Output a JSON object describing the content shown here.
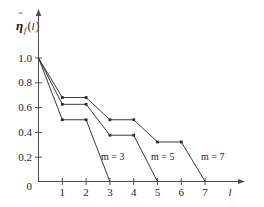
{
  "figure": {
    "name": "eta-hat-step-plot",
    "background_color": "#ffffff",
    "axis_color": "#4d4d4d",
    "curve_color": "#3a3a3a",
    "marker_color": "#2b2b2b"
  },
  "y_axis": {
    "label_base": "η",
    "label_hat": "ˆ",
    "label_subscript": "f",
    "label_argument": "l",
    "label_full": "η̂_f(l)",
    "ticks": [
      "1.0",
      "0.8",
      "0.6",
      "0.4",
      "0.2"
    ],
    "tick_values": [
      1.0,
      0.8,
      0.6,
      0.4,
      0.2
    ],
    "origin_label": "0",
    "range": [
      0,
      1.08
    ]
  },
  "x_axis": {
    "label": "l",
    "ticks": [
      "1",
      "2",
      "3",
      "4",
      "5",
      "6",
      "7"
    ],
    "tick_values": [
      1,
      2,
      3,
      4,
      5,
      6,
      7
    ],
    "range": [
      0,
      7.9
    ]
  },
  "annotations": [
    {
      "name": "label-m3",
      "prefix": "m",
      "equals": " = ",
      "value": "3",
      "text": "m = 3"
    },
    {
      "name": "label-m5",
      "prefix": "m",
      "equals": " = ",
      "value": "5",
      "text": "m = 5"
    },
    {
      "name": "label-m7",
      "prefix": "m",
      "equals": " = ",
      "value": "7",
      "text": "m = 7"
    }
  ],
  "chart_data": {
    "type": "line",
    "title": "",
    "xlabel": "l",
    "ylabel": "η̂_f(l)",
    "xlim": [
      0,
      7.9
    ],
    "ylim": [
      0,
      1.08
    ],
    "grid": false,
    "legend": "inline-annotations",
    "xticks": [
      0,
      1,
      2,
      3,
      4,
      5,
      6,
      7
    ],
    "xticklabels": [
      "0",
      "1",
      "2",
      "3",
      "4",
      "5",
      "6",
      "7"
    ],
    "yticks": [
      0.2,
      0.4,
      0.6,
      0.8,
      1.0
    ],
    "yticklabels": [
      "0.2",
      "0.4",
      "0.6",
      "0.8",
      "1.0"
    ],
    "series": [
      {
        "name": "m = 3",
        "x": [
          0,
          1,
          2,
          3
        ],
        "y": [
          1.0,
          0.5,
          0.5,
          0.0
        ],
        "markers_at": [
          [
            1,
            0.5
          ],
          [
            2,
            0.5
          ]
        ]
      },
      {
        "name": "m = 5",
        "x": [
          0,
          1,
          2,
          3,
          4,
          5
        ],
        "y": [
          1.0,
          0.625,
          0.625,
          0.375,
          0.375,
          0.0
        ],
        "markers_at": [
          [
            1,
            0.625
          ],
          [
            2,
            0.625
          ],
          [
            3,
            0.375
          ],
          [
            4,
            0.375
          ]
        ]
      },
      {
        "name": "m = 7",
        "x": [
          0,
          1,
          2,
          3,
          4,
          5,
          6,
          7
        ],
        "y": [
          1.0,
          0.68,
          0.68,
          0.5,
          0.5,
          0.32,
          0.32,
          0.0
        ],
        "markers_at": [
          [
            1,
            0.68
          ],
          [
            2,
            0.68
          ],
          [
            3,
            0.5
          ],
          [
            4,
            0.5
          ],
          [
            5,
            0.32
          ],
          [
            6,
            0.32
          ]
        ]
      }
    ]
  }
}
